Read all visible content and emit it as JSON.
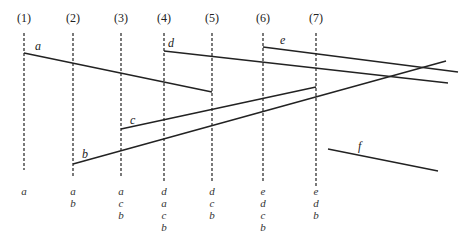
{
  "diagram": {
    "type": "sweep-line segment ordering",
    "stroke_color": "#222222",
    "sweep_lines": [
      {
        "label": "(1)",
        "x": 24,
        "y_top": 33,
        "y_bottom": 170,
        "stack": [
          "a"
        ]
      },
      {
        "label": "(2)",
        "x": 73,
        "y_top": 33,
        "y_bottom": 176,
        "stack": [
          "a",
          "b"
        ]
      },
      {
        "label": "(3)",
        "x": 121,
        "y_top": 33,
        "y_bottom": 176,
        "stack": [
          "a",
          "c",
          "b"
        ]
      },
      {
        "label": "(4)",
        "x": 164,
        "y_top": 33,
        "y_bottom": 182,
        "stack": [
          "d",
          "a",
          "c",
          "b"
        ]
      },
      {
        "label": "(5)",
        "x": 212,
        "y_top": 33,
        "y_bottom": 182,
        "stack": [
          "d",
          "c",
          "b"
        ]
      },
      {
        "label": "(6)",
        "x": 263,
        "y_top": 33,
        "y_bottom": 182,
        "stack": [
          "e",
          "d",
          "c",
          "b"
        ]
      },
      {
        "label": "(7)",
        "x": 316,
        "y_top": 33,
        "y_bottom": 188,
        "stack": [
          "e",
          "d",
          "b"
        ]
      }
    ],
    "segments": [
      {
        "label": "a",
        "x1": 24,
        "y1": 53,
        "x2": 212,
        "y2": 92,
        "label_x": 35,
        "label_y": 50
      },
      {
        "label": "b",
        "x1": 73,
        "y1": 164,
        "x2": 446,
        "y2": 61,
        "label_x": 82,
        "label_y": 158
      },
      {
        "label": "c",
        "x1": 121,
        "y1": 129,
        "x2": 316,
        "y2": 87,
        "label_x": 130,
        "label_y": 124
      },
      {
        "label": "d",
        "x1": 164,
        "y1": 51,
        "x2": 448,
        "y2": 83,
        "label_x": 168,
        "label_y": 47
      },
      {
        "label": "e",
        "x1": 263,
        "y1": 47,
        "x2": 458,
        "y2": 72,
        "label_x": 280,
        "label_y": 44
      },
      {
        "label": "f",
        "x1": 328,
        "y1": 149,
        "x2": 438,
        "y2": 171,
        "label_x": 358,
        "label_y": 150
      }
    ]
  }
}
